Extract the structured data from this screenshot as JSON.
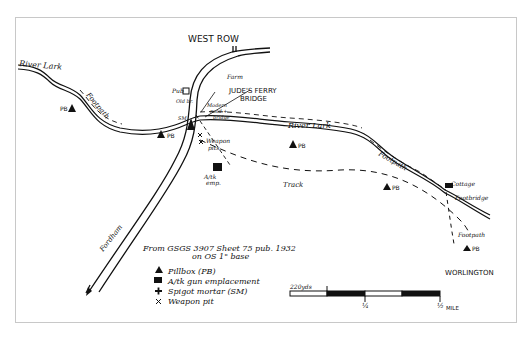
{
  "map": {
    "places": {
      "west_row": "WEST ROW",
      "worlington": "WORLINGTON",
      "farm": "Farm",
      "pub": "Pub",
      "jude_ferry_bridge_line1": "JUDE'S FERRY",
      "jude_ferry_bridge_line2": "BRIDGE",
      "modern_road_bridge_line1": "Modern",
      "modern_road_bridge_line2": "road +",
      "modern_road_bridge_line3": "bridge",
      "cottage": "Cottage",
      "footbridge": "Footbridge",
      "old_bridge": "Old br."
    },
    "features": {
      "river_lark_west": "River Lark",
      "river_lark_east": "River Lark",
      "footpath_west": "Footpath",
      "footpath_east": "Footpath",
      "footpath_south": "Footpath",
      "track": "Track",
      "fordham": "Fordham",
      "weapon_pits_line1": "Weapon",
      "weapon_pits_line2": "pits",
      "at_emp_line1": "A/tk",
      "at_emp_line2": "emp.",
      "sm": "SM"
    },
    "markers": {
      "pillbox_label": "PB"
    },
    "source": {
      "line1": "From GSGS 3907 Sheet 75 pub. 1932",
      "line2": "on OS 1\" base"
    },
    "legend": [
      {
        "icon": "pillbox-triangle-icon",
        "symbol": "▲",
        "label": "Pillbox (PB)"
      },
      {
        "icon": "anti-tank-square-icon",
        "symbol": "■",
        "label": "A/tk gun emplacement"
      },
      {
        "icon": "spigot-mortar-cross-icon",
        "symbol": "✚",
        "label": "Spigot mortar (SM)"
      },
      {
        "icon": "weapon-pit-x-icon",
        "symbol": "✕",
        "label": "Weapon pit"
      }
    ],
    "scale_bar": {
      "start_label": "220yds",
      "mid_label": "¼",
      "end_label": "½",
      "unit": "MILE"
    },
    "colors": {
      "ink": "#111111",
      "frame": "#c8c8c8",
      "paper": "#ffffff"
    }
  }
}
